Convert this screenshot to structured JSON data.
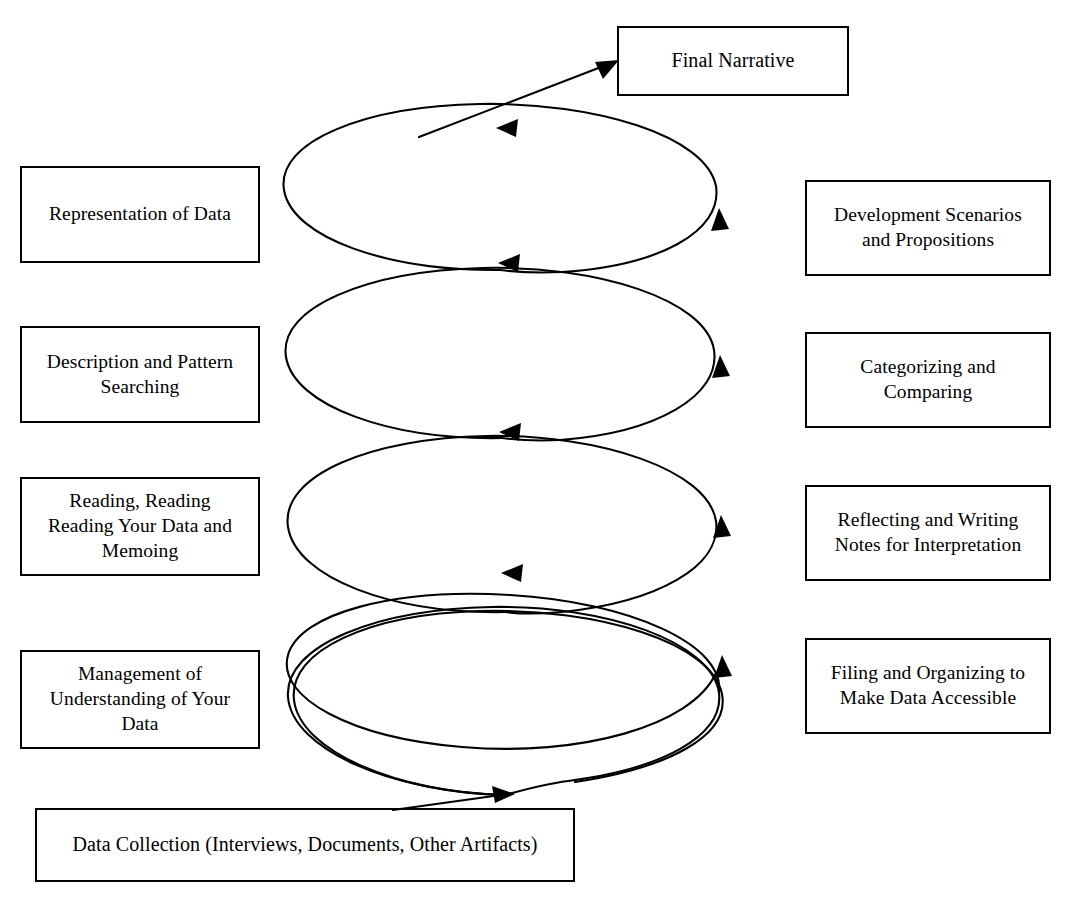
{
  "diagram": {
    "stroke_color": "#000000",
    "background_color": "#ffffff"
  },
  "nodes": {
    "final_narrative": {
      "label": "Final Narrative"
    },
    "data_collection": {
      "label": "Data Collection (Interviews, Documents, Other Artifacts)"
    },
    "left_column": [
      {
        "label": "Representation of Data"
      },
      {
        "label": "Description and Pattern\nSearching"
      },
      {
        "label": "Reading, Reading\nReading Your Data and\nMemoing"
      },
      {
        "label": "Management of\nUnderstanding of Your\nData"
      }
    ],
    "right_column": [
      {
        "label": "Development Scenarios\nand Propositions"
      },
      {
        "label": "Categorizing and\nComparing"
      },
      {
        "label": "Reflecting and Writing\nNotes for Interpretation"
      },
      {
        "label": "Filing and Organizing to\nMake Data Accessible"
      }
    ]
  },
  "spiral": {
    "loop_count": 4,
    "direction": "counterclockwise-upward",
    "top_arrow_direction": "left",
    "right_arrow_direction": "up",
    "bottom_arrow_direction": "right",
    "entry": "Data Collection (Interviews, Documents, Other Artifacts)",
    "exit": "Final Narrative"
  }
}
